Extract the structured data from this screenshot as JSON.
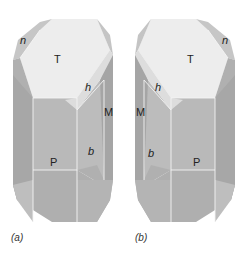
{
  "figure": {
    "panels": [
      {
        "id": "a",
        "caption": "(a)",
        "faces": {
          "top": "T",
          "upper_left": "n",
          "diagonal": "h",
          "side": "M",
          "bottom": "P",
          "small": "b"
        }
      },
      {
        "id": "b",
        "caption": "(b)",
        "faces": {
          "top": "T",
          "upper_right": "n",
          "diagonal": "h",
          "side": "M",
          "bottom": "P",
          "small": "b"
        }
      }
    ],
    "colors": {
      "top_face": "#ececec",
      "diagonal_face": "#dcdcdc",
      "n_face": "#c9c9c9",
      "front_face": "#b8b8b8",
      "dark_side": "#a3a3a3",
      "bottom_face": "#adadad",
      "bottom_side": "#bfbfbf"
    }
  }
}
